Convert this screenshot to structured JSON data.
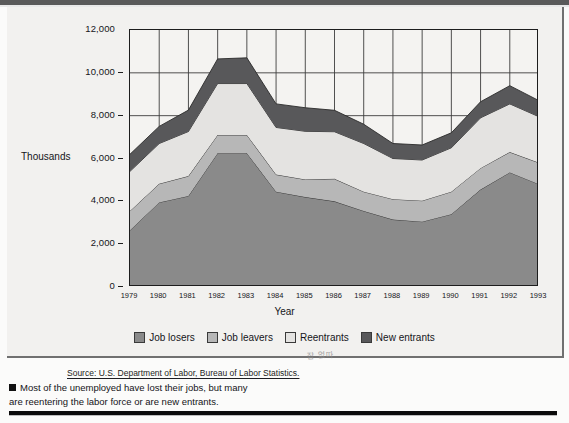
{
  "figure": {
    "axis_title_y": "Thousands",
    "axis_title_x": "Year",
    "source": "Source: U.S. Department of Labor, Bureau of Labor Statistics.",
    "annotation_scribble": "잡 없따",
    "caption_line1": "Most of the unemployed have lost their jobs, but many",
    "caption_line2": "are reentering the labor force or are new entrants."
  },
  "legend": {
    "items": [
      {
        "label": "Job losers",
        "color": "#8a8a8a"
      },
      {
        "label": "Job leavers",
        "color": "#b7b7b7"
      },
      {
        "label": "Reentrants",
        "color": "#e4e3e1"
      },
      {
        "label": "New entrants",
        "color": "#58585a"
      }
    ]
  },
  "chart_data": {
    "type": "area",
    "stacked": true,
    "title": "",
    "subtitle": "",
    "xlabel": "Year",
    "ylabel": "Thousands",
    "ylim": [
      0,
      12000
    ],
    "yticks": [
      0,
      2000,
      4000,
      6000,
      8000,
      10000,
      12000
    ],
    "ytick_labels": [
      "0",
      "2,000",
      "4,000",
      "6,000",
      "8,000",
      "10,000",
      "12,000"
    ],
    "grid": true,
    "legend_position": "bottom",
    "categories": [
      "1979",
      "1980",
      "1981",
      "1982",
      "1983",
      "1984",
      "1985",
      "1986",
      "1987",
      "1988",
      "1989",
      "1990",
      "1991",
      "1992",
      "1993"
    ],
    "series": [
      {
        "name": "Job losers",
        "color": "#8a8a8a",
        "values": [
          2650,
          3950,
          4250,
          6250,
          6250,
          4450,
          4200,
          4000,
          3550,
          3150,
          3050,
          3400,
          4550,
          5350,
          4800
        ]
      },
      {
        "name": "Job leavers",
        "color": "#b7b7b7",
        "values": [
          900,
          870,
          930,
          850,
          850,
          800,
          820,
          1050,
          900,
          950,
          980,
          1050,
          1000,
          950,
          1000
        ]
      },
      {
        "name": "Reentrants",
        "color": "#e4e3e1",
        "values": [
          1850,
          1880,
          2080,
          2400,
          2400,
          2200,
          2250,
          2200,
          2250,
          1900,
          1900,
          2050,
          2350,
          2250,
          2150
        ]
      },
      {
        "name": "New entrants",
        "color": "#58585a",
        "values": [
          800,
          800,
          1000,
          1150,
          1200,
          1100,
          1100,
          1000,
          900,
          700,
          700,
          700,
          750,
          850,
          750
        ]
      }
    ],
    "totals": [
      6200,
      7500,
      8260,
      10650,
      10700,
      8550,
      8370,
      8250,
      7600,
      6700,
      6630,
      7200,
      8650,
      9400,
      8700
    ]
  }
}
